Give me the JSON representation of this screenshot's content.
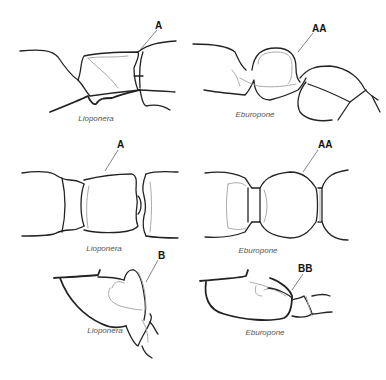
{
  "panels": [
    {
      "id": "top-left",
      "caption": "Lioponera",
      "label": "A"
    },
    {
      "id": "top-right",
      "caption": "Eburopone",
      "label": "AA"
    },
    {
      "id": "mid-left",
      "caption": "Lioponera",
      "label": "A"
    },
    {
      "id": "mid-right",
      "caption": "Eburopone",
      "label": "AA"
    },
    {
      "id": "bottom-left",
      "caption": "Lioponera",
      "label": "B"
    },
    {
      "id": "bottom-right",
      "caption": "Eburopone",
      "label": "BB"
    }
  ]
}
